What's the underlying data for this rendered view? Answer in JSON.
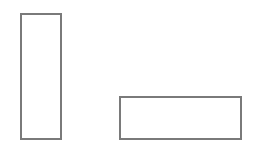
{
  "canvas": {
    "width": 254,
    "height": 144,
    "background": "#ffffff"
  },
  "shapes": [
    {
      "id": "tall-rectangle",
      "type": "rectangle",
      "x": 20,
      "y": 13,
      "width": 42,
      "height": 127,
      "stroke": "#7a7a7a",
      "stroke_width": 2
    },
    {
      "id": "wide-rectangle",
      "type": "rectangle",
      "x": 119,
      "y": 96,
      "width": 123,
      "height": 44,
      "stroke": "#7a7a7a",
      "stroke_width": 2
    }
  ]
}
